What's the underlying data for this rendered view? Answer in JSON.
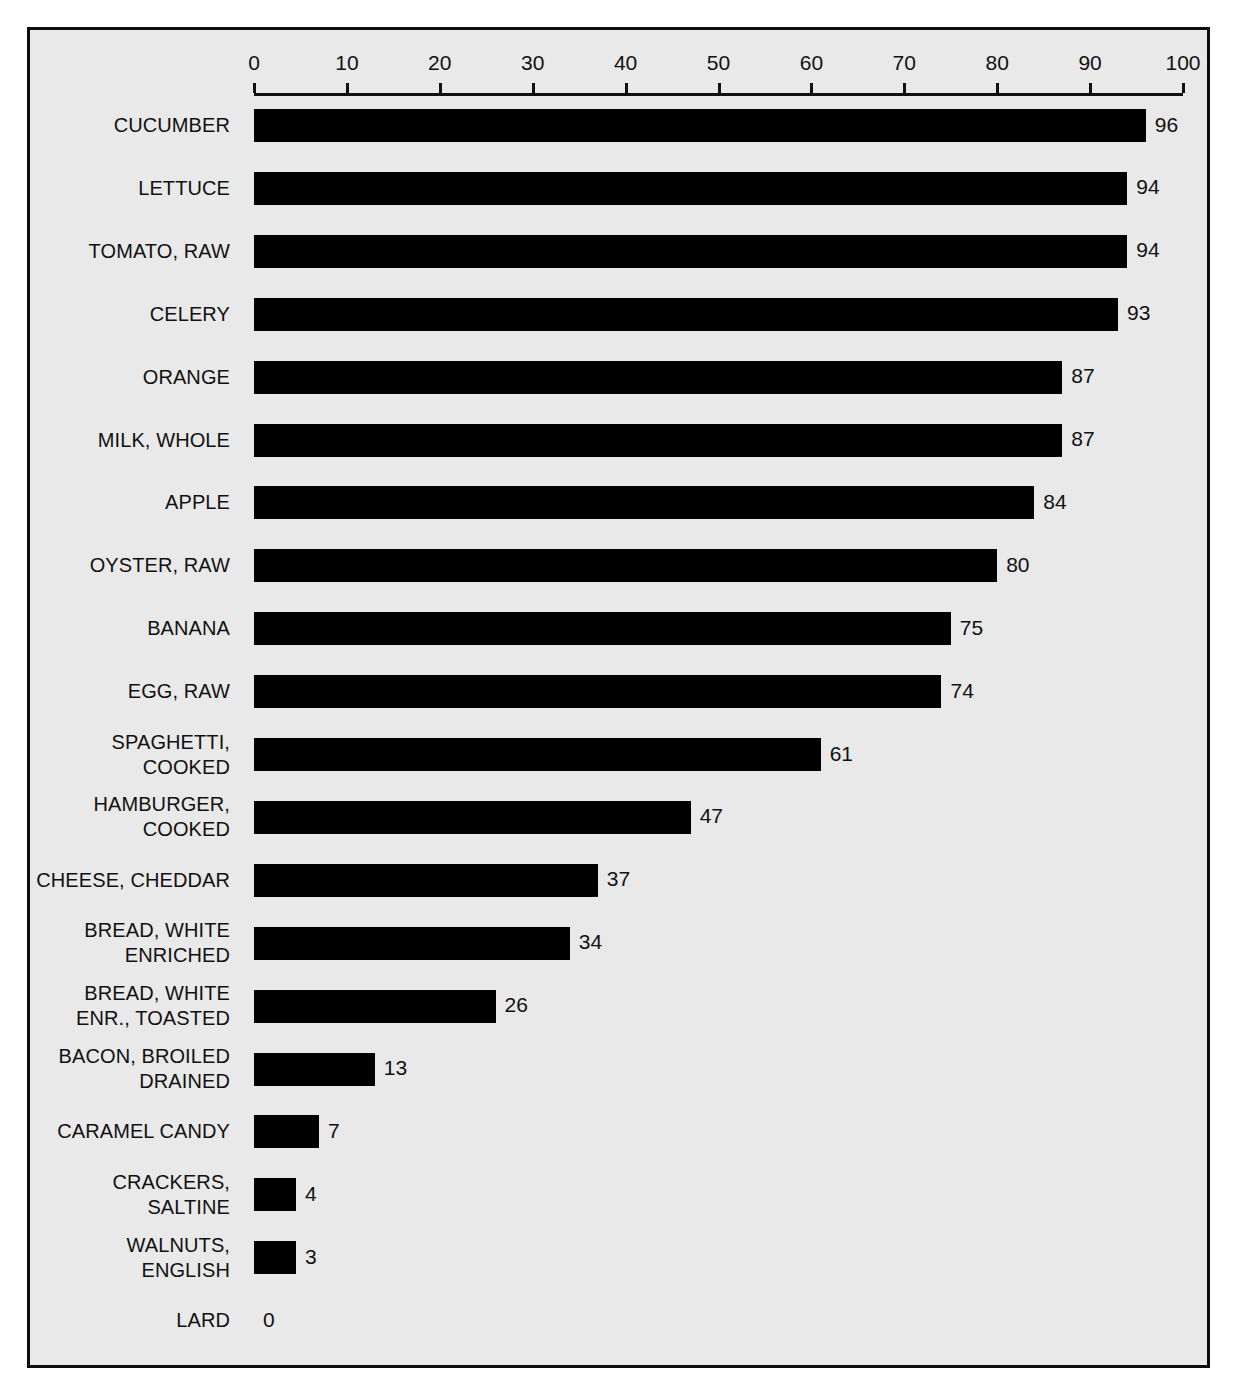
{
  "chart_data": {
    "type": "bar",
    "orientation": "horizontal",
    "title": "",
    "subtitle": "",
    "xlabel": "",
    "ylabel": "",
    "xlim": [
      0,
      100
    ],
    "xticks": [
      0,
      10,
      20,
      30,
      40,
      50,
      60,
      70,
      80,
      90,
      100
    ],
    "xtick_labels": [
      "0",
      "10",
      "20",
      "30",
      "40",
      "50",
      "60",
      "70",
      "80",
      "90",
      "100"
    ],
    "grid": false,
    "legend": null,
    "axis_position": "top",
    "value_labels": true,
    "bar_color": "#000000",
    "background_color": "#e9e9e9",
    "frame_color": "#0d0d0d",
    "categories": [
      "CUCUMBER",
      "LETTUCE",
      "TOMATO, RAW",
      "CELERY",
      "ORANGE",
      "MILK, WHOLE",
      "APPLE",
      "OYSTER, RAW",
      "BANANA",
      "EGG, RAW",
      "SPAGHETTI,\nCOOKED",
      "HAMBURGER,\nCOOKED",
      "CHEESE, CHEDDAR",
      "BREAD, WHITE\nENRICHED",
      "BREAD, WHITE\nENR., TOASTED",
      "BACON, BROILED\nDRAINED",
      "CARAMEL CANDY",
      "CRACKERS,\nSALTINE",
      "WALNUTS,\nENGLISH",
      "LARD"
    ],
    "values": [
      96,
      94,
      94,
      93,
      87,
      87,
      84,
      80,
      75,
      74,
      61,
      47,
      37,
      34,
      26,
      13,
      7,
      4,
      3,
      0
    ],
    "value_label_text": [
      "96",
      "94",
      "94",
      "93",
      "87",
      "87",
      "84",
      "80",
      "75",
      "74",
      "61",
      "47",
      "37",
      "34",
      "26",
      "13",
      "7",
      "4",
      "3",
      "0"
    ]
  }
}
